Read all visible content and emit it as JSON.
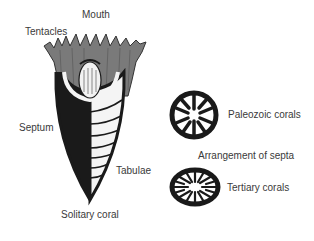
{
  "diagram": {
    "solitary_coral": {
      "caption": "Solitary coral",
      "labels": {
        "mouth": "Mouth",
        "tentacles": "Tentacles",
        "septum": "Septum",
        "tabulae": "Tabulae"
      }
    },
    "septa_arrangement": {
      "title": "Arrangement of septa",
      "items": [
        {
          "label": "Paleozoic corals"
        },
        {
          "label": "Tertiary corals"
        }
      ]
    },
    "colors": {
      "ink": "#1a1a1a",
      "polyp_gray": "#6e6e6e",
      "background": "#ffffff"
    }
  }
}
